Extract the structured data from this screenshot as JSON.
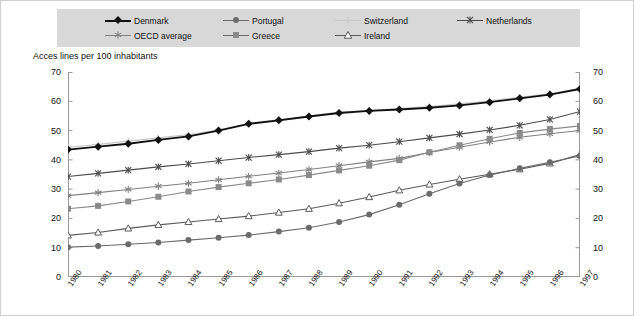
{
  "axis_title": "Acces lines per 100 inhabitants",
  "legend": {
    "items": [
      {
        "label": "Denmark",
        "marker": "diamond-marker",
        "color": "#111111",
        "line": "#111111"
      },
      {
        "label": "Portugal",
        "marker": "circle-marker",
        "color": "#6b6b6b",
        "line": "#6b6b6b"
      },
      {
        "label": "Switzerland",
        "marker": "plus-marker",
        "color": "#c9c9c9",
        "line": "#c9c9c9"
      },
      {
        "label": "Netherlands",
        "marker": "x-marker",
        "color": "#4a4a4a",
        "line": "#4a4a4a"
      },
      {
        "label": "OECD average",
        "marker": "asterisk-marker",
        "color": "#808080",
        "line": "#808080"
      },
      {
        "label": "Greece",
        "marker": "square-marker",
        "color": "#8a8a8a",
        "line": "#6f6f6f"
      },
      {
        "label": "Ireland",
        "marker": "triangle-marker",
        "color": "#ffffff",
        "line": "#5a5a5a"
      }
    ],
    "background": "#d8d8d8"
  },
  "y_axis": {
    "ticks": [
      "0",
      "10",
      "20",
      "30",
      "40",
      "50",
      "60",
      "70"
    ],
    "min": 0,
    "max": 70,
    "step": 10
  },
  "x_axis": {
    "ticks": [
      "1980",
      "1981",
      "1982",
      "1983",
      "1984",
      "1985",
      "1986",
      "1987",
      "1988",
      "1989",
      "1990",
      "1991",
      "1992",
      "1993",
      "1994",
      "1995",
      "1996",
      "1997"
    ]
  },
  "chart_data": {
    "type": "line",
    "title": "",
    "xlabel": "",
    "ylabel": "Acces lines per 100 inhabitants",
    "xlim": [
      1980,
      1997
    ],
    "ylim": [
      0,
      70
    ],
    "grid": false,
    "legend_position": "top",
    "x": [
      1980,
      1981,
      1982,
      1983,
      1984,
      1985,
      1986,
      1987,
      1988,
      1989,
      1990,
      1991,
      1992,
      1993,
      1994,
      1995,
      1996,
      1997
    ],
    "series": [
      {
        "name": "Denmark",
        "marker": "diamond",
        "color": "#111111",
        "values": [
          43.5,
          44.5,
          45.5,
          46.8,
          48.0,
          50.0,
          52.3,
          53.5,
          54.8,
          56.0,
          56.7,
          57.2,
          57.8,
          58.6,
          59.7,
          61.0,
          62.3,
          64.2
        ]
      },
      {
        "name": "Switzerland",
        "marker": "plus",
        "color": "#c9c9c9",
        "values": [
          44.3,
          45.3,
          46.4,
          47.5,
          48.6,
          50.3,
          52.4,
          53.8,
          55.0,
          56.2,
          56.9,
          57.5,
          58.2,
          59.1,
          60.2,
          61.4,
          62.6,
          64.4
        ]
      },
      {
        "name": "Netherlands",
        "marker": "x",
        "color": "#4a4a4a",
        "values": [
          34.3,
          35.4,
          36.5,
          37.6,
          38.6,
          39.7,
          40.8,
          41.8,
          42.8,
          44.0,
          45.0,
          46.2,
          47.5,
          48.8,
          50.2,
          51.8,
          53.8,
          56.5
        ]
      },
      {
        "name": "OECD average",
        "marker": "asterisk",
        "color": "#808080",
        "values": [
          27.8,
          28.8,
          29.9,
          31.0,
          32.0,
          33.2,
          34.4,
          35.5,
          36.7,
          38.0,
          39.3,
          40.5,
          42.5,
          44.3,
          46.1,
          47.7,
          48.9,
          50.0
        ]
      },
      {
        "name": "Greece",
        "marker": "square",
        "color": "#8a8a8a",
        "values": [
          23.3,
          24.3,
          25.8,
          27.4,
          29.2,
          30.7,
          32.0,
          33.3,
          34.8,
          36.4,
          38.0,
          39.9,
          42.6,
          45.0,
          47.2,
          49.2,
          50.5,
          51.6
        ]
      },
      {
        "name": "Ireland",
        "marker": "triangle",
        "color": "#5a5a5a",
        "values": [
          14.2,
          15.2,
          16.6,
          17.8,
          18.8,
          19.8,
          20.8,
          22.0,
          23.3,
          25.2,
          27.3,
          29.6,
          31.6,
          33.4,
          35.1,
          36.8,
          38.8,
          41.8
        ]
      },
      {
        "name": "Portugal",
        "marker": "circle",
        "color": "#6b6b6b",
        "values": [
          10.2,
          10.6,
          11.2,
          11.8,
          12.6,
          13.4,
          14.3,
          15.5,
          16.8,
          18.8,
          21.3,
          24.7,
          28.4,
          31.9,
          34.8,
          37.1,
          39.2,
          41.3
        ]
      }
    ]
  }
}
